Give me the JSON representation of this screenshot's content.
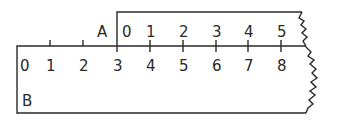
{
  "diagram": {
    "type": "ruler-addition",
    "colors": {
      "ink": "#2a2a2a",
      "background": "#ffffff"
    },
    "ruler_a": {
      "name": "A",
      "ticks": [
        "0",
        "1",
        "2",
        "3",
        "4",
        "5"
      ],
      "aligned_with_b_value": "3"
    },
    "ruler_b": {
      "name": "B",
      "ticks": [
        "0",
        "1",
        "2",
        "3",
        "4",
        "5",
        "6",
        "7",
        "8"
      ]
    }
  }
}
